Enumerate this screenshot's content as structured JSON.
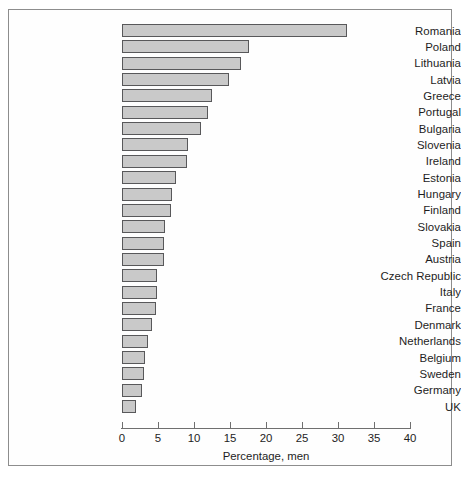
{
  "chart_data": {
    "type": "bar",
    "orientation": "horizontal",
    "title": "",
    "xlabel": "Percentage, men",
    "ylabel": "",
    "xlim": [
      0,
      40
    ],
    "xticks": [
      0,
      5,
      10,
      15,
      20,
      25,
      30,
      35,
      40
    ],
    "grid": false,
    "legend": false,
    "bar_fill_color": "#c9c9c9",
    "bar_border_color": "#58585a",
    "categories": [
      "Romania",
      "Poland",
      "Lithuania",
      "Latvia",
      "Greece",
      "Portugal",
      "Bulgaria",
      "Slovenia",
      "Ireland",
      "Estonia",
      "Hungary",
      "Finland",
      "Slovakia",
      "Spain",
      "Austria",
      "Czech Republic",
      "Italy",
      "France",
      "Denmark",
      "Netherlands",
      "Belgium",
      "Sweden",
      "Germany",
      "UK"
    ],
    "values": [
      31.2,
      17.6,
      16.5,
      14.8,
      12.5,
      12.0,
      11.0,
      9.2,
      9.0,
      7.5,
      7.0,
      6.8,
      6.0,
      5.9,
      5.8,
      4.9,
      4.8,
      4.7,
      4.2,
      3.6,
      3.2,
      3.1,
      2.8,
      2.0
    ]
  }
}
